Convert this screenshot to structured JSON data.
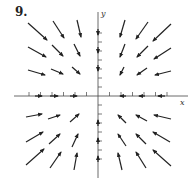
{
  "figure": {
    "label": "9.",
    "x_axis_label": "x",
    "y_axis_label": "y"
  },
  "chart_data": {
    "type": "vector_field",
    "title": "9.",
    "xlabel": "x",
    "ylabel": "y",
    "origin_px": [
      98,
      96
    ],
    "arrows_px": [
      {
        "from": [
          28,
          23
        ],
        "to": [
          47,
          40
        ]
      },
      {
        "from": [
          53,
          21
        ],
        "to": [
          64,
          38
        ]
      },
      {
        "from": [
          77,
          20
        ],
        "to": [
          81,
          37
        ]
      },
      {
        "from": [
          28,
          47
        ],
        "to": [
          46,
          57
        ]
      },
      {
        "from": [
          52,
          45
        ],
        "to": [
          63,
          56
        ]
      },
      {
        "from": [
          74,
          44
        ],
        "to": [
          80,
          56
        ]
      },
      {
        "from": [
          28,
          70
        ],
        "to": [
          45,
          75
        ]
      },
      {
        "from": [
          51,
          69
        ],
        "to": [
          63,
          74
        ]
      },
      {
        "from": [
          72,
          67
        ],
        "to": [
          80,
          74
        ]
      },
      {
        "from": [
          125,
          20
        ],
        "to": [
          120,
          37
        ]
      },
      {
        "from": [
          148,
          22
        ],
        "to": [
          136,
          39
        ]
      },
      {
        "from": [
          171,
          24
        ],
        "to": [
          153,
          41
        ]
      },
      {
        "from": [
          125,
          44
        ],
        "to": [
          120,
          57
        ]
      },
      {
        "from": [
          148,
          46
        ],
        "to": [
          137,
          57
        ]
      },
      {
        "from": [
          171,
          48
        ],
        "to": [
          154,
          59
        ]
      },
      {
        "from": [
          124,
          67
        ],
        "to": [
          120,
          75
        ]
      },
      {
        "from": [
          147,
          68
        ],
        "to": [
          137,
          75
        ]
      },
      {
        "from": [
          171,
          71
        ],
        "to": [
          155,
          75
        ]
      },
      {
        "from": [
          26,
          117
        ],
        "to": [
          42,
          114
        ]
      },
      {
        "from": [
          48,
          119
        ],
        "to": [
          60,
          115
        ]
      },
      {
        "from": [
          70,
          122
        ],
        "to": [
          79,
          114
        ]
      },
      {
        "from": [
          26,
          142
        ],
        "to": [
          43,
          132
        ]
      },
      {
        "from": [
          49,
          144
        ],
        "to": [
          60,
          134
        ]
      },
      {
        "from": [
          72,
          147
        ],
        "to": [
          78,
          134
        ]
      },
      {
        "from": [
          26,
          165
        ],
        "to": [
          44,
          149
        ]
      },
      {
        "from": [
          50,
          168
        ],
        "to": [
          61,
          152
        ]
      },
      {
        "from": [
          74,
          170
        ],
        "to": [
          77,
          153
        ]
      },
      {
        "from": [
          126,
          123
        ],
        "to": [
          118,
          115
        ]
      },
      {
        "from": [
          147,
          121
        ],
        "to": [
          136,
          115
        ]
      },
      {
        "from": [
          171,
          119
        ],
        "to": [
          154,
          115
        ]
      },
      {
        "from": [
          126,
          146
        ],
        "to": [
          118,
          134
        ]
      },
      {
        "from": [
          146,
          144
        ],
        "to": [
          136,
          134
        ]
      },
      {
        "from": [
          170,
          142
        ],
        "to": [
          153,
          132
        ]
      },
      {
        "from": [
          122,
          170
        ],
        "to": [
          118,
          153
        ]
      },
      {
        "from": [
          146,
          168
        ],
        "to": [
          136,
          152
        ]
      },
      {
        "from": [
          171,
          166
        ],
        "to": [
          153,
          150
        ]
      }
    ],
    "axis_arrows_px": [
      {
        "from": [
          35,
          96
        ],
        "to": [
          42,
          96
        ]
      },
      {
        "from": [
          50,
          96
        ],
        "to": [
          58,
          96
        ]
      },
      {
        "from": [
          70,
          96
        ],
        "to": [
          77,
          96
        ]
      },
      {
        "from": [
          126,
          96
        ],
        "to": [
          120,
          96
        ]
      },
      {
        "from": [
          145,
          96
        ],
        "to": [
          139,
          96
        ]
      },
      {
        "from": [
          165,
          96
        ],
        "to": [
          158,
          96
        ]
      },
      {
        "from": [
          98,
          29
        ],
        "to": [
          98,
          35
        ]
      },
      {
        "from": [
          98,
          47
        ],
        "to": [
          98,
          53
        ]
      },
      {
        "from": [
          98,
          65
        ],
        "to": [
          98,
          71
        ]
      },
      {
        "from": [
          98,
          126
        ],
        "to": [
          98,
          120
        ]
      },
      {
        "from": [
          98,
          144
        ],
        "to": [
          98,
          138
        ]
      },
      {
        "from": [
          98,
          162
        ],
        "to": [
          98,
          156
        ]
      }
    ],
    "grid": false
  }
}
